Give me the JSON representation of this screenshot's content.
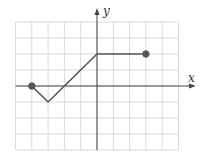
{
  "chart_data": {
    "type": "line",
    "title": "",
    "xlabel": "x",
    "ylabel": "y",
    "xlim": [
      -5,
      5
    ],
    "ylim": [
      -4,
      4
    ],
    "grid": true,
    "grid_step": 1,
    "tick_labels": false,
    "series": [
      {
        "name": "graph",
        "points": [
          [
            -4,
            0
          ],
          [
            -3,
            -1
          ],
          [
            0,
            2
          ],
          [
            3,
            2
          ]
        ],
        "endpoints": {
          "start": {
            "x": -4,
            "y": 0,
            "closed": true
          },
          "end": {
            "x": 3,
            "y": 2,
            "closed": true
          }
        }
      }
    ]
  },
  "axis_labels": {
    "x": "x",
    "y": "y"
  },
  "colors": {
    "grid": "#d9d9d9",
    "axis": "#444444",
    "line": "#555555",
    "dot": "#555555"
  }
}
